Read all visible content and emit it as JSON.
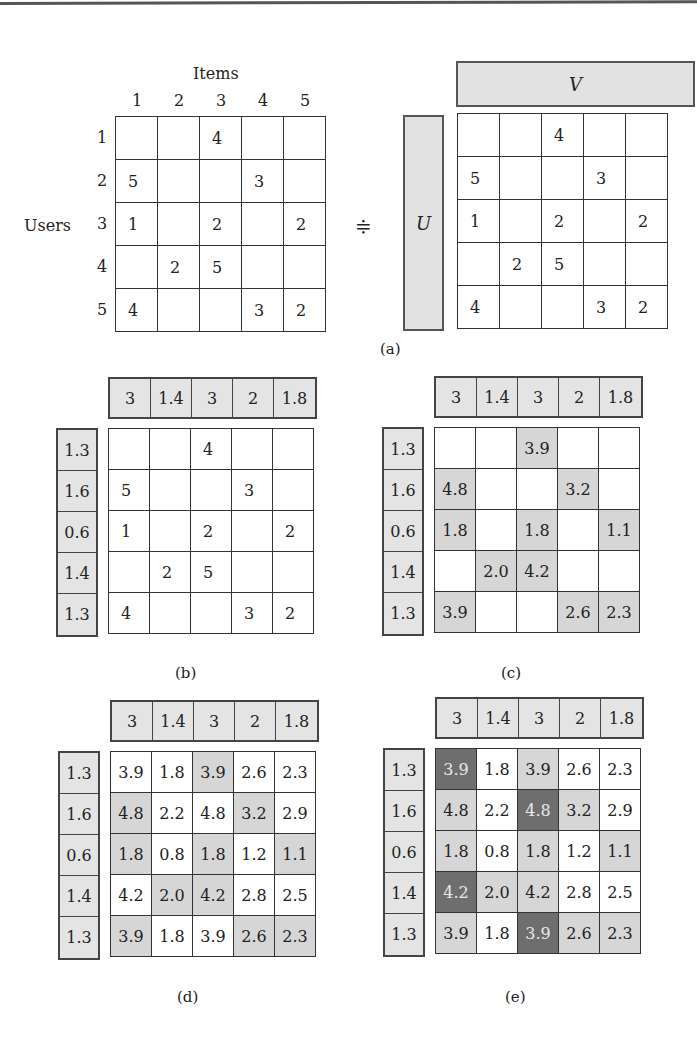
{
  "panel_a": {
    "items_label": "Items",
    "users_label": "Users",
    "approx_symbol": "≑",
    "col_headers": [
      "1",
      "2",
      "3",
      "4",
      "5"
    ],
    "row_headers": [
      "1",
      "2",
      "3",
      "4",
      "5"
    ],
    "ratings": [
      [
        "",
        "",
        "4",
        "",
        ""
      ],
      [
        "5",
        "",
        "",
        "3",
        ""
      ],
      [
        "1",
        "",
        "2",
        "",
        "2"
      ],
      [
        "",
        "2",
        "5",
        "",
        ""
      ],
      [
        "4",
        "",
        "",
        "3",
        "2"
      ]
    ],
    "v_label": "V",
    "u_label": "U",
    "caption": "(a)"
  },
  "factors": {
    "v": [
      "3",
      "1.4",
      "3",
      "2",
      "1.8"
    ],
    "u": [
      "1.3",
      "1.6",
      "0.6",
      "1.4",
      "1.3"
    ]
  },
  "panel_b": {
    "caption": "(b)",
    "cells": [
      [
        "",
        "",
        "4",
        "",
        ""
      ],
      [
        "5",
        "",
        "",
        "3",
        ""
      ],
      [
        "1",
        "",
        "2",
        "",
        "2"
      ],
      [
        "",
        "2",
        "5",
        "",
        ""
      ],
      [
        "4",
        "",
        "",
        "3",
        "2"
      ]
    ]
  },
  "panel_c": {
    "caption": "(c)",
    "cells": [
      [
        "",
        "",
        "3.9",
        "",
        ""
      ],
      [
        "4.8",
        "",
        "",
        "3.2",
        ""
      ],
      [
        "1.8",
        "",
        "1.8",
        "",
        "1.1"
      ],
      [
        "",
        "2.0",
        "4.2",
        "",
        ""
      ],
      [
        "3.9",
        "",
        "",
        "2.6",
        "2.3"
      ]
    ],
    "shading": [
      [
        0,
        0,
        1,
        0,
        0
      ],
      [
        1,
        0,
        0,
        1,
        0
      ],
      [
        1,
        0,
        1,
        0,
        1
      ],
      [
        0,
        1,
        1,
        0,
        0
      ],
      [
        1,
        0,
        0,
        1,
        1
      ]
    ]
  },
  "panel_d": {
    "caption": "(d)",
    "cells": [
      [
        "3.9",
        "1.8",
        "3.9",
        "2.6",
        "2.3"
      ],
      [
        "4.8",
        "2.2",
        "4.8",
        "3.2",
        "2.9"
      ],
      [
        "1.8",
        "0.8",
        "1.8",
        "1.2",
        "1.1"
      ],
      [
        "4.2",
        "2.0",
        "4.2",
        "2.8",
        "2.5"
      ],
      [
        "3.9",
        "1.8",
        "3.9",
        "2.6",
        "2.3"
      ]
    ],
    "shading": [
      [
        0,
        0,
        1,
        0,
        0
      ],
      [
        1,
        0,
        0,
        1,
        0
      ],
      [
        1,
        0,
        1,
        0,
        1
      ],
      [
        0,
        1,
        1,
        0,
        0
      ],
      [
        1,
        0,
        0,
        1,
        1
      ]
    ]
  },
  "panel_e": {
    "caption": "(e)",
    "cells": [
      [
        "3.9",
        "1.8",
        "3.9",
        "2.6",
        "2.3"
      ],
      [
        "4.8",
        "2.2",
        "4.8",
        "3.2",
        "2.9"
      ],
      [
        "1.8",
        "0.8",
        "1.8",
        "1.2",
        "1.1"
      ],
      [
        "4.2",
        "2.0",
        "4.2",
        "2.8",
        "2.5"
      ],
      [
        "3.9",
        "1.8",
        "3.9",
        "2.6",
        "2.3"
      ]
    ],
    "shading": [
      [
        2,
        0,
        1,
        0,
        0
      ],
      [
        1,
        0,
        2,
        1,
        0
      ],
      [
        1,
        0,
        1,
        0,
        1
      ],
      [
        2,
        1,
        1,
        0,
        0
      ],
      [
        1,
        0,
        2,
        1,
        1
      ]
    ]
  },
  "colors": {
    "factor_fill": "#e4e4e4",
    "observed_fill": "#d6d6d6",
    "recommended_fill": "#6e6e6e",
    "grid_line": "#333333"
  }
}
